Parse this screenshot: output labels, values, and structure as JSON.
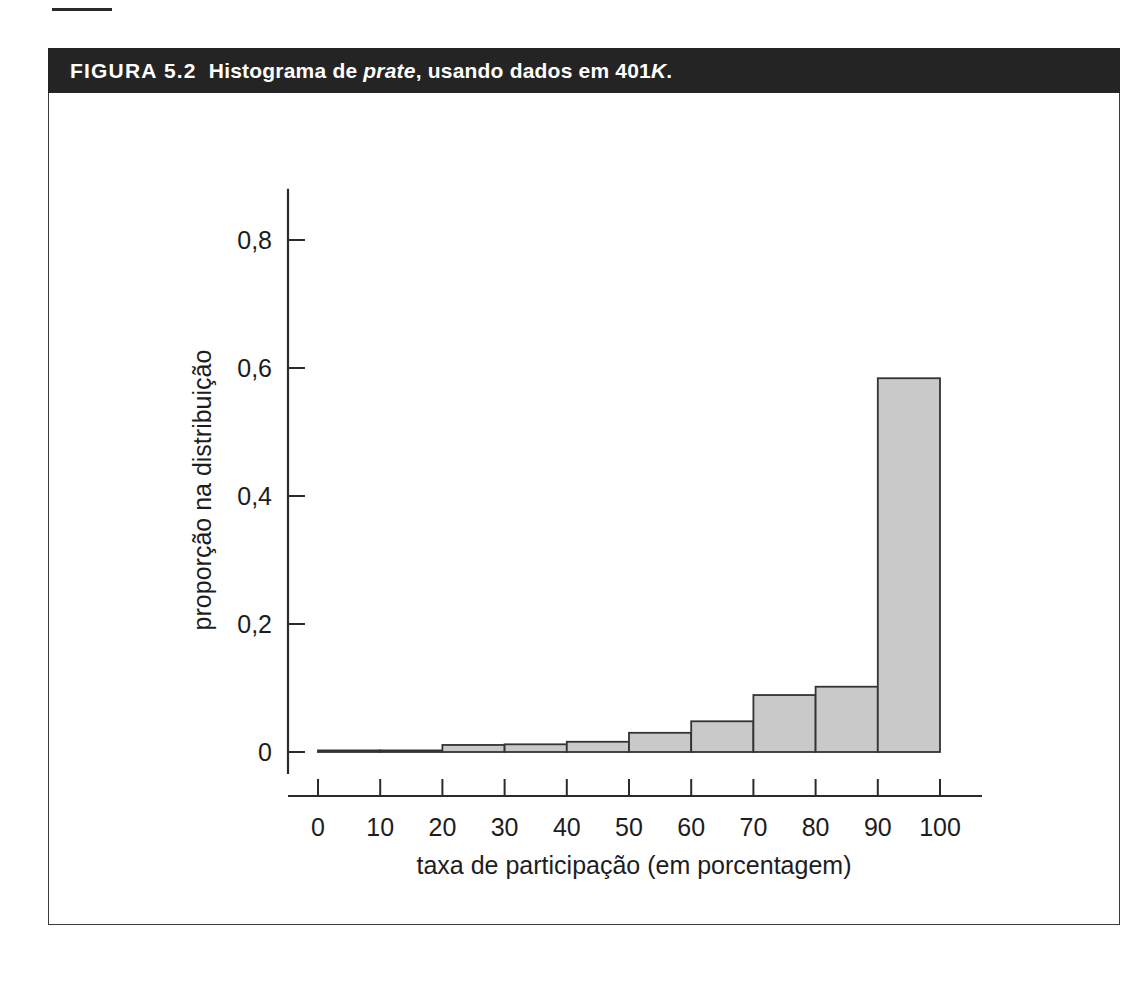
{
  "figure": {
    "label": "FIGURA 5.2",
    "caption_prefix": "Histograma de ",
    "caption_italic_1": "prate",
    "caption_mid": ", usando dados em 401",
    "caption_italic_2": "K",
    "caption_suffix": ".",
    "full_title": "FIGURA 5.2  Histograma de prate, usando dados em 401K."
  },
  "colors": {
    "banner_bg": "#242424",
    "banner_text": "#ffffff",
    "bar_fill": "#c9c9c9",
    "bar_stroke": "#333333",
    "axis": "#2b2b2b",
    "page_bg": "#ffffff"
  },
  "chart_data": {
    "type": "bar",
    "title": "Histograma de prate, usando dados em 401K.",
    "xlabel": "taxa de participação (em porcentagem)",
    "ylabel": "proporção na distribuição",
    "xlim": [
      0,
      100
    ],
    "ylim": [
      0,
      0.9
    ],
    "grid": false,
    "legend": "none",
    "bin_width": 10,
    "xticks": [
      "0",
      "10",
      "20",
      "30",
      "40",
      "50",
      "60",
      "70",
      "80",
      "90",
      "100"
    ],
    "xtick_values": [
      0,
      10,
      20,
      30,
      40,
      50,
      60,
      70,
      80,
      90,
      100
    ],
    "yticks": [
      "0",
      "0,2",
      "0,4",
      "0,6",
      "0,8"
    ],
    "ytick_values": [
      0,
      0.2,
      0.4,
      0.6,
      0.8
    ],
    "bins": [
      {
        "range": "0-10",
        "x0": 0,
        "x1": 10,
        "value": 0.002
      },
      {
        "range": "10-20",
        "x0": 10,
        "x1": 20,
        "value": 0.002
      },
      {
        "range": "20-30",
        "x0": 20,
        "x1": 30,
        "value": 0.011
      },
      {
        "range": "30-40",
        "x0": 30,
        "x1": 40,
        "value": 0.012
      },
      {
        "range": "40-50",
        "x0": 40,
        "x1": 50,
        "value": 0.016
      },
      {
        "range": "50-60",
        "x0": 50,
        "x1": 60,
        "value": 0.03
      },
      {
        "range": "60-70",
        "x0": 60,
        "x1": 70,
        "value": 0.048
      },
      {
        "range": "70-80",
        "x0": 70,
        "x1": 80,
        "value": 0.089
      },
      {
        "range": "80-90",
        "x0": 80,
        "x1": 90,
        "value": 0.102
      },
      {
        "range": "90-100",
        "x0": 90,
        "x1": 100,
        "value": 0.584
      }
    ],
    "categories": [
      "0-10",
      "10-20",
      "20-30",
      "30-40",
      "40-50",
      "50-60",
      "60-70",
      "70-80",
      "80-90",
      "90-100"
    ],
    "values": [
      0.002,
      0.002,
      0.011,
      0.012,
      0.016,
      0.03,
      0.048,
      0.089,
      0.102,
      0.584
    ]
  }
}
